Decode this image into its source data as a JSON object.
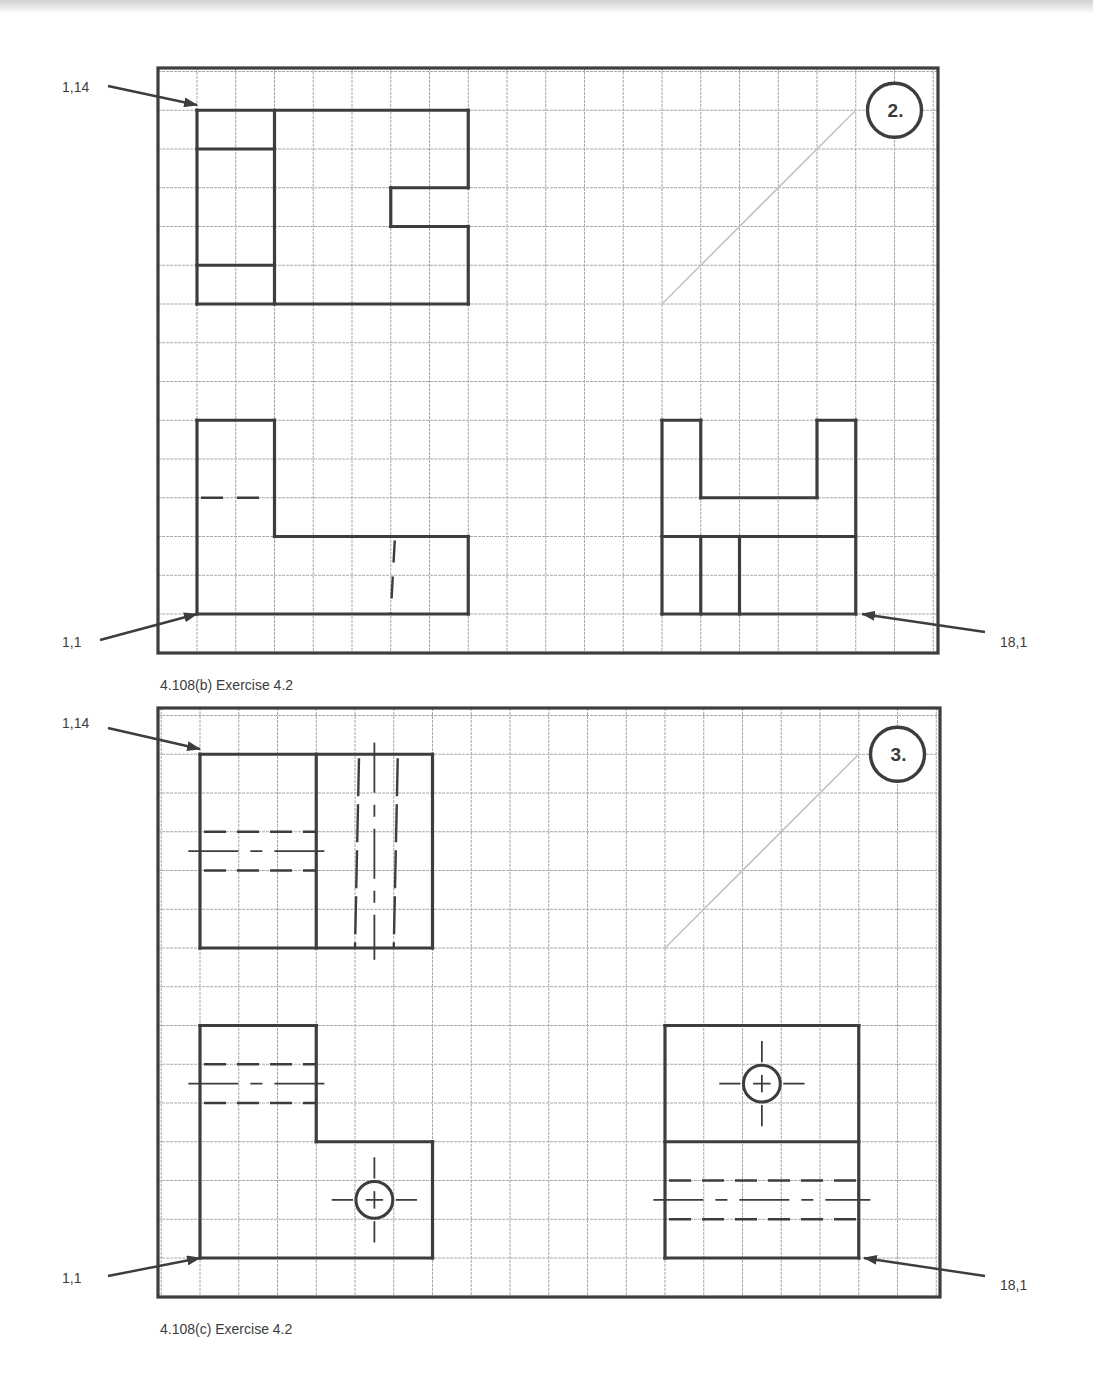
{
  "figures": [
    {
      "id": "b",
      "caption": "4.108(b)  Exercise 4.2",
      "badge": "2.",
      "frame": {
        "x": 158,
        "y": 68,
        "w": 780,
        "h": 585
      },
      "origin": {
        "x": 197,
        "y": 614
      },
      "step": 38.75,
      "labels": {
        "top_left": "1,14",
        "bottom_left": "1,1",
        "bottom_right": "18,1"
      },
      "label_pos": {
        "top_left": {
          "tx": 62,
          "ty": 92,
          "ax1": 108,
          "ay1": 86,
          "ax2": 197,
          "ay2": 105
        },
        "bottom_left": {
          "tx": 62,
          "ty": 647,
          "ax1": 100,
          "ay1": 640,
          "ax2": 197,
          "ay2": 614
        },
        "bottom_right": {
          "tx": 1000,
          "ty": 647,
          "ax1": 985,
          "ay1": 632,
          "ax2": 862,
          "ay2": 614
        }
      },
      "solid_lines": [
        [
          [
            1,
            14
          ],
          [
            8,
            14
          ]
        ],
        [
          [
            1,
            14
          ],
          [
            1,
            9
          ]
        ],
        [
          [
            1,
            9
          ],
          [
            8,
            9
          ]
        ],
        [
          [
            3,
            14
          ],
          [
            3,
            9
          ]
        ],
        [
          [
            1,
            13
          ],
          [
            3,
            13
          ]
        ],
        [
          [
            1,
            10
          ],
          [
            3,
            10
          ]
        ],
        [
          [
            8,
            14
          ],
          [
            8,
            12
          ]
        ],
        [
          [
            8,
            12
          ],
          [
            6,
            12
          ]
        ],
        [
          [
            6,
            12
          ],
          [
            6,
            11
          ]
        ],
        [
          [
            6,
            11
          ],
          [
            8,
            11
          ]
        ],
        [
          [
            8,
            11
          ],
          [
            8,
            9
          ]
        ],
        [
          [
            1,
            6
          ],
          [
            1,
            1
          ]
        ],
        [
          [
            1,
            6
          ],
          [
            3,
            6
          ]
        ],
        [
          [
            3,
            6
          ],
          [
            3,
            3
          ]
        ],
        [
          [
            3,
            3
          ],
          [
            8,
            3
          ]
        ],
        [
          [
            8,
            3
          ],
          [
            8,
            1
          ]
        ],
        [
          [
            1,
            1
          ],
          [
            8,
            1
          ]
        ],
        [
          [
            13,
            6
          ],
          [
            14,
            6
          ]
        ],
        [
          [
            14,
            6
          ],
          [
            14,
            4
          ]
        ],
        [
          [
            14,
            4
          ],
          [
            17,
            4
          ]
        ],
        [
          [
            17,
            4
          ],
          [
            17,
            6
          ]
        ],
        [
          [
            17,
            6
          ],
          [
            18,
            6
          ]
        ],
        [
          [
            13,
            6
          ],
          [
            13,
            1
          ]
        ],
        [
          [
            18,
            6
          ],
          [
            18,
            1
          ]
        ],
        [
          [
            13,
            1
          ],
          [
            18,
            1
          ]
        ],
        [
          [
            13,
            3
          ],
          [
            18,
            3
          ]
        ],
        [
          [
            14,
            3
          ],
          [
            14,
            1
          ]
        ],
        [
          [
            15,
            3
          ],
          [
            15,
            1
          ]
        ]
      ],
      "hidden_lines": [
        {
          "pts": [
            [
              1,
              4
            ],
            [
              3,
              4
            ]
          ],
          "dash": "22 14"
        },
        {
          "pts": [
            [
              6,
              3
            ],
            [
              6,
              1
            ]
          ],
          "dash": "22 14"
        }
      ],
      "center_lines": [],
      "holes": [],
      "miter": [
        [
          13,
          9
        ],
        [
          18,
          14
        ]
      ]
    },
    {
      "id": "c",
      "caption": "4.108(c)  Exercise 4.2",
      "badge": "3.",
      "frame": {
        "x": 158,
        "y": 708,
        "w": 782,
        "h": 589
      },
      "origin": {
        "x": 200,
        "y": 1258
      },
      "step": 38.75,
      "labels": {
        "top_left": "1,14",
        "bottom_left": "1,1",
        "bottom_right": "18,1"
      },
      "label_pos": {
        "top_left": {
          "tx": 62,
          "ty": 728,
          "ax1": 108,
          "ay1": 728,
          "ax2": 200,
          "ay2": 749
        },
        "bottom_left": {
          "tx": 62,
          "ty": 1283,
          "ax1": 108,
          "ay1": 1276,
          "ax2": 200,
          "ay2": 1258
        },
        "bottom_right": {
          "tx": 1000,
          "ty": 1290,
          "ax1": 985,
          "ay1": 1276,
          "ax2": 864,
          "ay2": 1258
        }
      },
      "solid_lines": [
        [
          [
            1,
            14
          ],
          [
            7,
            14
          ]
        ],
        [
          [
            1,
            14
          ],
          [
            1,
            9
          ]
        ],
        [
          [
            1,
            9
          ],
          [
            7,
            9
          ]
        ],
        [
          [
            7,
            14
          ],
          [
            7,
            9
          ]
        ],
        [
          [
            4,
            14
          ],
          [
            4,
            9
          ]
        ],
        [
          [
            1,
            7
          ],
          [
            4,
            7
          ]
        ],
        [
          [
            4,
            7
          ],
          [
            4,
            4
          ]
        ],
        [
          [
            4,
            4
          ],
          [
            7,
            4
          ]
        ],
        [
          [
            7,
            4
          ],
          [
            7,
            1
          ]
        ],
        [
          [
            1,
            7
          ],
          [
            1,
            1
          ]
        ],
        [
          [
            1,
            1
          ],
          [
            7,
            1
          ]
        ],
        [
          [
            13,
            7
          ],
          [
            18,
            7
          ]
        ],
        [
          [
            13,
            7
          ],
          [
            13,
            1
          ]
        ],
        [
          [
            18,
            7
          ],
          [
            18,
            1
          ]
        ],
        [
          [
            13,
            1
          ],
          [
            18,
            1
          ]
        ],
        [
          [
            13,
            4
          ],
          [
            18,
            4
          ]
        ]
      ],
      "hidden_lines": [
        {
          "pts": [
            [
              1,
              12
            ],
            [
              4,
              12
            ]
          ],
          "dash": "22 11"
        },
        {
          "pts": [
            [
              1,
              11
            ],
            [
              4,
              11
            ]
          ],
          "dash": "22 11"
        },
        {
          "pts": [
            [
              5,
              14
            ],
            [
              5,
              9
            ]
          ],
          "dash": "38 8"
        },
        {
          "pts": [
            [
              6,
              14
            ],
            [
              6,
              9
            ]
          ],
          "dash": "38 8"
        },
        {
          "pts": [
            [
              1,
              6
            ],
            [
              4,
              6
            ]
          ],
          "dash": "22 11"
        },
        {
          "pts": [
            [
              1,
              5
            ],
            [
              4,
              5
            ]
          ],
          "dash": "22 11"
        },
        {
          "pts": [
            [
              13,
              3
            ],
            [
              18,
              3
            ]
          ],
          "dash": "22 11"
        },
        {
          "pts": [
            [
              13,
              2
            ],
            [
              18,
              2
            ]
          ],
          "dash": "22 11"
        }
      ],
      "center_lines": [
        [
          [
            0.7,
            11.5
          ],
          [
            4.3,
            11.5
          ]
        ],
        [
          [
            5.5,
            14.3
          ],
          [
            5.5,
            8.7
          ]
        ],
        [
          [
            0.7,
            5.5
          ],
          [
            4.3,
            5.5
          ]
        ],
        [
          [
            12.7,
            2.5
          ],
          [
            18.3,
            2.5
          ]
        ]
      ],
      "holes": [
        {
          "cx": 5.5,
          "cy": 2.5,
          "r": 0.5
        },
        {
          "cx": 15.5,
          "cy": 5.5,
          "r": 0.5
        }
      ],
      "miter": [
        [
          13,
          9
        ],
        [
          18,
          14
        ]
      ]
    }
  ],
  "colors": {
    "outline": "#3d3d3d",
    "grid": "#a9a9a9",
    "miter": "#c4c4c4",
    "text": "#3c3c3c"
  }
}
